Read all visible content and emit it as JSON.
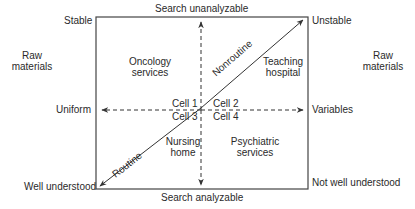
{
  "diagram": {
    "type": "2x2 technology matrix",
    "axes": {
      "top": "Search unanalyzable",
      "bottom": "Search analyzable",
      "left": "Uniform",
      "right": "Variables"
    },
    "corners": {
      "top_left": "Stable",
      "top_right": "Unstable",
      "bottom_left": "Well understood",
      "bottom_right": "Not well understood"
    },
    "side_labels": {
      "left": [
        "Raw",
        "materials"
      ],
      "right": [
        "Raw",
        "materials"
      ]
    },
    "diagonal": {
      "upper": "Nonroutine",
      "lower": "Routine"
    },
    "cells": [
      {
        "id": "Cell 1",
        "example": [
          "Oncology",
          "services"
        ]
      },
      {
        "id": "Cell 2",
        "example": [
          "Teaching",
          "hospital"
        ]
      },
      {
        "id": "Cell 3",
        "example": [
          "Nursing",
          "home"
        ]
      },
      {
        "id": "Cell 4",
        "example": [
          "Psychiatric",
          "services"
        ]
      }
    ]
  }
}
